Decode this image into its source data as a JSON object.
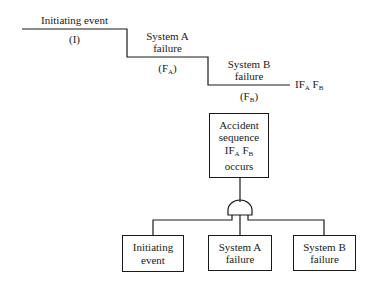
{
  "event_tree": {
    "initiating_event": {
      "label": "Initiating event",
      "symbol": "(I)"
    },
    "system_a": {
      "line1": "System A",
      "line2": "failure",
      "symbol_base": "(F",
      "symbol_sub": "A",
      "symbol_end": ")"
    },
    "system_b": {
      "line1": "System B",
      "line2": "failure",
      "symbol_base": "(F",
      "symbol_sub": "B",
      "symbol_end": ")"
    },
    "outcome": {
      "p1": "IF",
      "s1": "A",
      "p2": " F",
      "s2": "B"
    }
  },
  "fault_tree": {
    "top_event": {
      "line1": "Accident",
      "line2": "sequence",
      "line3_p1": "IF",
      "line3_s1": "A",
      "line3_p2": " F",
      "line3_s2": "B",
      "line4": "occurs"
    },
    "gate": "and-gate",
    "inputs": [
      {
        "line1": "Initiating",
        "line2": "event"
      },
      {
        "line1": "System A",
        "line2": "failure"
      },
      {
        "line1": "System B",
        "line2": "failure"
      }
    ]
  }
}
